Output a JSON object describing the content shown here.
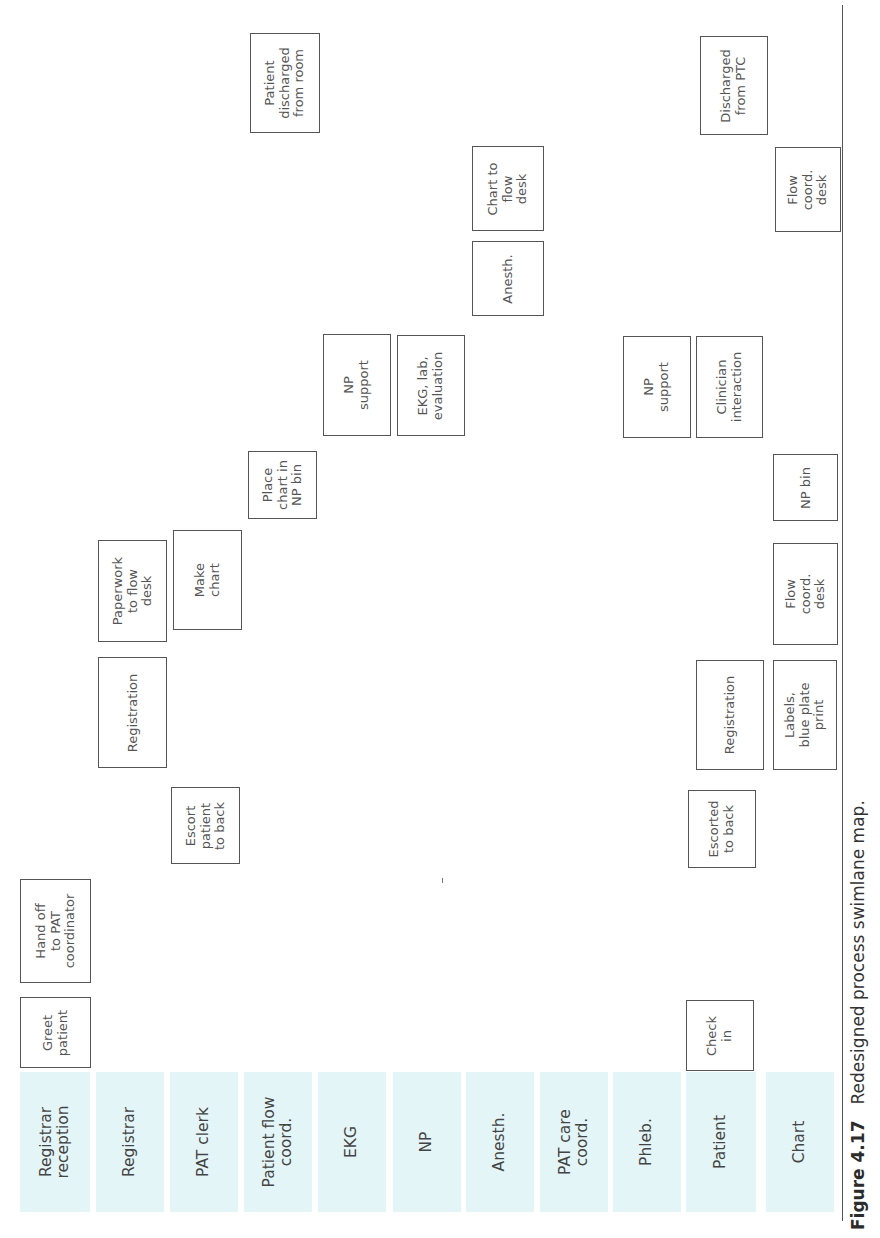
{
  "figure": {
    "number_label": "Figure 4.17",
    "caption": "Redesigned process swimlane map."
  },
  "colors": {
    "lane_header_bg": "#e4f5f7",
    "box_border": "#555555"
  },
  "lanes": [
    {
      "label": "Registrar\nreception",
      "x": 20,
      "w": 70
    },
    {
      "label": "Registrar",
      "x": 96,
      "w": 68
    },
    {
      "label": "PAT clerk",
      "x": 170,
      "w": 68
    },
    {
      "label": "Patient flow\ncoord.",
      "x": 244,
      "w": 68
    },
    {
      "label": "EKG",
      "x": 318,
      "w": 68
    },
    {
      "label": "NP",
      "x": 393,
      "w": 68
    },
    {
      "label": "Anesth.",
      "x": 466,
      "w": 68
    },
    {
      "label": "PAT care\ncoord.",
      "x": 540,
      "w": 68
    },
    {
      "label": "Phleb.",
      "x": 613,
      "w": 68
    },
    {
      "label": "Patient",
      "x": 686,
      "w": 70
    },
    {
      "label": "Chart",
      "x": 766,
      "w": 68
    }
  ],
  "steps": [
    {
      "lane": "Registrar reception",
      "label": "Greet\npatient",
      "x": 20,
      "y": 997,
      "w": 71,
      "h": 71
    },
    {
      "lane": "Registrar reception",
      "label": "Hand off\nto PAT\ncoordinator",
      "x": 20,
      "y": 879,
      "w": 71,
      "h": 104
    },
    {
      "lane": "Registrar",
      "label": "Registration",
      "x": 98,
      "y": 657,
      "w": 69,
      "h": 111
    },
    {
      "lane": "Registrar",
      "label": "Paperwork\nto flow\ndesk",
      "x": 98,
      "y": 540,
      "w": 69,
      "h": 102
    },
    {
      "lane": "PAT clerk",
      "label": "Escort\npatient\nto back",
      "x": 171,
      "y": 787,
      "w": 69,
      "h": 77
    },
    {
      "lane": "PAT clerk",
      "label": "Make\nchart",
      "x": 173,
      "y": 530,
      "w": 69,
      "h": 100
    },
    {
      "lane": "Patient flow coord.",
      "label": "Place\nchart in\nNP bin",
      "x": 248,
      "y": 451,
      "w": 69,
      "h": 68
    },
    {
      "lane": "Patient flow coord.",
      "label": "Patient\ndischarged\nfrom room",
      "x": 250,
      "y": 33,
      "w": 70,
      "h": 100
    },
    {
      "lane": "EKG",
      "label": "NP\nsupport",
      "x": 323,
      "y": 334,
      "w": 68,
      "h": 102
    },
    {
      "lane": "NP",
      "label": "EKG, lab,\nevaluation",
      "x": 397,
      "y": 335,
      "w": 68,
      "h": 101
    },
    {
      "lane": "Anesth.",
      "label": "Anesth.",
      "x": 472,
      "y": 241,
      "w": 72,
      "h": 75
    },
    {
      "lane": "Anesth.",
      "label": "Chart to\nflow\ndesk",
      "x": 472,
      "y": 146,
      "w": 72,
      "h": 85
    },
    {
      "lane": "Phleb.",
      "label": "NP\nsupport",
      "x": 623,
      "y": 336,
      "w": 68,
      "h": 102
    },
    {
      "lane": "Patient",
      "label": "Check\nin",
      "x": 686,
      "y": 1000,
      "w": 68,
      "h": 71
    },
    {
      "lane": "Patient",
      "label": "Escorted\nto back",
      "x": 688,
      "y": 790,
      "w": 68,
      "h": 78
    },
    {
      "lane": "Patient",
      "label": "Registration",
      "x": 696,
      "y": 660,
      "w": 68,
      "h": 110
    },
    {
      "lane": "Patient",
      "label": "Clinician\ninteraction",
      "x": 696,
      "y": 336,
      "w": 67,
      "h": 102
    },
    {
      "lane": "Patient",
      "label": "Discharged\nfrom PTC",
      "x": 700,
      "y": 36,
      "w": 68,
      "h": 99
    },
    {
      "lane": "Chart",
      "label": "Labels,\nblue plate\nprint",
      "x": 773,
      "y": 660,
      "w": 64,
      "h": 110
    },
    {
      "lane": "Chart",
      "label": "Flow\ncoord.\ndesk",
      "x": 773,
      "y": 543,
      "w": 65,
      "h": 102
    },
    {
      "lane": "Chart",
      "label": "NP bin",
      "x": 773,
      "y": 454,
      "w": 65,
      "h": 67
    },
    {
      "lane": "Chart",
      "label": "Flow\ncoord.\ndesk",
      "x": 775,
      "y": 147,
      "w": 66,
      "h": 85
    }
  ]
}
